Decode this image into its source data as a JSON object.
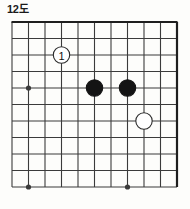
{
  "figure": {
    "caption": "12도",
    "type": "go-board-diagram"
  },
  "board": {
    "columns": 11,
    "rows": 11,
    "origin_x": 12,
    "origin_y": 4,
    "cell": 16.5,
    "line_color": "#3b3b3b",
    "border_color": "#1e1e1e",
    "background_color": "#fdfdfb",
    "line_width": 1.1,
    "border_width": 2.2,
    "stone_radius": 8.2,
    "star_radius": 2.6,
    "star_points": [
      {
        "col": 1,
        "row": 4
      },
      {
        "col": 1,
        "row": 10
      },
      {
        "col": 7,
        "row": 10
      }
    ]
  },
  "stones": [
    {
      "id": "white-move-1",
      "color": "white",
      "col": 3,
      "row": 2,
      "label": "1",
      "label_color": "#111111",
      "fill": "#ffffff",
      "stroke": "#2a2a2a"
    },
    {
      "id": "black-stone-a",
      "color": "black",
      "col": 5,
      "row": 4,
      "label": "",
      "fill": "#141414",
      "stroke": "#141414"
    },
    {
      "id": "black-stone-b",
      "color": "black",
      "col": 7,
      "row": 4,
      "label": "",
      "fill": "#141414",
      "stroke": "#141414"
    },
    {
      "id": "white-stone-c",
      "color": "white",
      "col": 8,
      "row": 6,
      "label": "",
      "fill": "#ffffff",
      "stroke": "#2a2a2a"
    }
  ],
  "chart_data": {
    "type": "table",
    "title": "12도",
    "xlabel": "",
    "ylabel": "",
    "categories": [
      "column",
      "row",
      "color",
      "label"
    ],
    "values": [
      [
        3,
        2,
        "white",
        "1"
      ],
      [
        5,
        4,
        "black",
        ""
      ],
      [
        7,
        4,
        "black",
        ""
      ],
      [
        8,
        6,
        "white",
        ""
      ]
    ]
  }
}
